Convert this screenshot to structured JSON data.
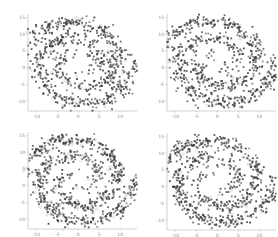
{
  "chart_data": [
    {
      "type": "scatter",
      "panel": "top-left",
      "title": "",
      "xlabel": "",
      "ylabel": "",
      "xlim": [
        -12,
        14
      ],
      "ylim": [
        -13,
        16
      ],
      "xticks": [
        -10,
        -5,
        0,
        5,
        10
      ],
      "yticks": [
        -10,
        -5,
        0,
        5,
        10,
        15
      ],
      "grid": false,
      "legend": null,
      "description": "Two-armed spiral point cloud; gray filled markers with faint gray open markers/trajectory lines",
      "series": [
        {
          "name": "spiral arm A",
          "shape": "spiral",
          "theta_range_rad": [
            1.5,
            9.5
          ],
          "radius_scale": 1.55,
          "noise": 1.1,
          "n_points": 380,
          "marker_color": "#3c3c3c"
        },
        {
          "name": "spiral arm B",
          "shape": "spiral",
          "theta_range_rad": [
            1.5,
            9.5
          ],
          "radius_scale": 1.55,
          "rotation_rad": 3.1416,
          "noise": 1.1,
          "n_points": 380,
          "marker_color": "#3c3c3c"
        },
        {
          "name": "overlay",
          "shape": "open-circle",
          "n_points": 60,
          "marker_color": "#b0b0b0"
        }
      ],
      "seed": 11
    },
    {
      "type": "scatter",
      "panel": "top-right",
      "title": "",
      "xlabel": "",
      "ylabel": "",
      "xlim": [
        -12,
        14
      ],
      "ylim": [
        -13,
        16
      ],
      "xticks": [
        -10,
        -5,
        0,
        5,
        10
      ],
      "yticks": [
        -10,
        -5,
        0,
        5,
        10,
        15
      ],
      "grid": false,
      "legend": null,
      "description": "Two-armed spiral point cloud; gray filled markers",
      "series": [
        {
          "name": "spiral arm A",
          "shape": "spiral",
          "theta_range_rad": [
            1.5,
            9.5
          ],
          "radius_scale": 1.55,
          "noise": 1.1,
          "n_points": 380,
          "marker_color": "#3c3c3c"
        },
        {
          "name": "spiral arm B",
          "shape": "spiral",
          "theta_range_rad": [
            1.5,
            9.5
          ],
          "radius_scale": 1.55,
          "rotation_rad": 3.1416,
          "noise": 1.1,
          "n_points": 380,
          "marker_color": "#3c3c3c"
        },
        {
          "name": "overlay",
          "shape": "open-circle",
          "n_points": 40,
          "marker_color": "#b0b0b0"
        }
      ],
      "seed": 23
    },
    {
      "type": "scatter",
      "panel": "bottom-left",
      "title": "",
      "xlabel": "",
      "ylabel": "",
      "xlim": [
        -12,
        14
      ],
      "ylim": [
        -13,
        16
      ],
      "xticks": [
        -10,
        -5,
        0,
        5,
        10
      ],
      "yticks": [
        -10,
        -5,
        0,
        5,
        10,
        15
      ],
      "grid": false,
      "legend": null,
      "description": "Two-armed spiral point cloud; mix of dark filled and light gray markers",
      "series": [
        {
          "name": "spiral arm A",
          "shape": "spiral",
          "theta_range_rad": [
            1.5,
            9.5
          ],
          "radius_scale": 1.55,
          "noise": 1.0,
          "n_points": 380,
          "marker_color": "#3c3c3c"
        },
        {
          "name": "spiral arm B",
          "shape": "spiral",
          "theta_range_rad": [
            1.5,
            9.5
          ],
          "radius_scale": 1.55,
          "rotation_rad": 3.1416,
          "noise": 1.0,
          "n_points": 380,
          "marker_color": "#3c3c3c"
        },
        {
          "name": "overlay",
          "shape": "open-circle",
          "n_points": 140,
          "marker_color": "#b0b0b0"
        }
      ],
      "seed": 37
    },
    {
      "type": "scatter",
      "panel": "bottom-right",
      "title": "",
      "xlabel": "",
      "ylabel": "",
      "xlim": [
        -12,
        14
      ],
      "ylim": [
        -13,
        16
      ],
      "xticks": [
        -10,
        -5,
        0,
        5,
        10
      ],
      "yticks": [
        -10,
        -5,
        0,
        5,
        10,
        15
      ],
      "grid": false,
      "legend": null,
      "description": "Two-armed spiral point cloud; gray filled markers",
      "series": [
        {
          "name": "spiral arm A",
          "shape": "spiral",
          "theta_range_rad": [
            1.5,
            9.5
          ],
          "radius_scale": 1.55,
          "noise": 1.0,
          "n_points": 380,
          "marker_color": "#3c3c3c"
        },
        {
          "name": "spiral arm B",
          "shape": "spiral",
          "theta_range_rad": [
            1.5,
            9.5
          ],
          "radius_scale": 1.55,
          "rotation_rad": 3.1416,
          "noise": 1.0,
          "n_points": 380,
          "marker_color": "#3c3c3c"
        },
        {
          "name": "overlay",
          "shape": "open-circle",
          "n_points": 30,
          "marker_color": "#b0b0b0"
        }
      ],
      "seed": 53
    }
  ],
  "panels": [
    {
      "id": "top-left",
      "left": 0,
      "top": 0
    },
    {
      "id": "top-right",
      "left": 139,
      "top": 0
    },
    {
      "id": "bottom-left",
      "left": 0,
      "top": 118
    },
    {
      "id": "bottom-right",
      "left": 139,
      "top": 119
    }
  ],
  "plot_area": {
    "x0": 28,
    "x1": 137,
    "y0": 14,
    "y1": 111
  },
  "colors": {
    "axis": "#b5b5b5",
    "tick_text": "#8a8a8a",
    "marker_dark": "#3c3c3c",
    "marker_light": "#b0b0b0",
    "background": "#ffffff"
  }
}
